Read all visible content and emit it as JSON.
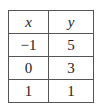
{
  "table": {
    "headers": [
      "x",
      "y"
    ],
    "rows": [
      [
        "−1",
        "5"
      ],
      [
        "0",
        "3"
      ],
      [
        "1",
        "1"
      ]
    ]
  }
}
